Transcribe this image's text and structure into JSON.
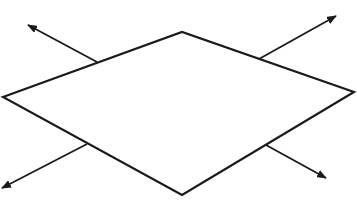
{
  "diagram": {
    "colors": {
      "stroke": "#1a1a1a",
      "background": "#ffffff"
    },
    "rhombus": {
      "vertices": [
        [
          3,
          97
        ],
        [
          182,
          32
        ],
        [
          354,
          92
        ],
        [
          182,
          195
        ]
      ],
      "stroke_width": 2.2
    },
    "arrows": [
      {
        "name": "arrow-top-left",
        "from": [
          97,
          62
        ],
        "to": [
          28,
          25
        ]
      },
      {
        "name": "arrow-top-right",
        "from": [
          259,
          59
        ],
        "to": [
          336,
          16
        ]
      },
      {
        "name": "arrow-bottom-left",
        "from": [
          87,
          144
        ],
        "to": [
          2,
          188
        ]
      },
      {
        "name": "arrow-bottom-right",
        "from": [
          266,
          145
        ],
        "to": [
          326,
          178
        ]
      }
    ],
    "arrow_stroke_width": 1.8
  }
}
